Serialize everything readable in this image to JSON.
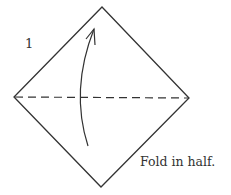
{
  "step": {
    "number": "1",
    "caption": "Fold in half."
  },
  "diagram": {
    "shape": "square-diamond",
    "vertices": {
      "top": [
        102,
        7
      ],
      "left": [
        14,
        97
      ],
      "right": [
        189,
        98
      ],
      "bottom": [
        101,
        187
      ]
    },
    "fold_line": "horizontal-dashed",
    "arrow": "curved-upward",
    "stroke_color": "#333333"
  }
}
